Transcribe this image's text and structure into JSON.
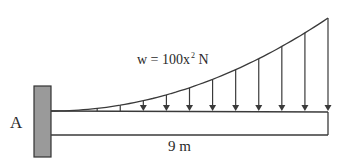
{
  "diagram": {
    "type": "cantilever-beam-distributed-load",
    "support": {
      "label": "A",
      "type": "fixed-wall"
    },
    "load": {
      "label_prefix": "w = 100x",
      "label_exponent": "2",
      "label_unit": " N",
      "arrow_count": 12
    },
    "beam": {
      "length_label": "9 m"
    },
    "colors": {
      "line": "#3a3a3a",
      "wall_fill": "#9a9a9a",
      "wall_border": "#333333",
      "background": "#ffffff"
    }
  }
}
